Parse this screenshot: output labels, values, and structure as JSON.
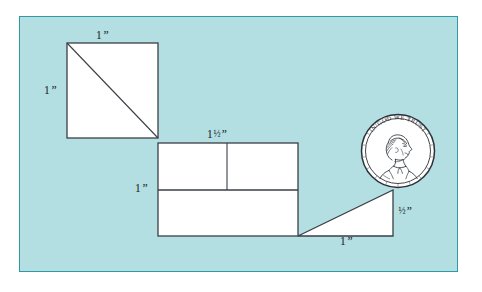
{
  "figure": {
    "panel": {
      "background_color": "#b3dee2",
      "border_color": "#2e9aa6",
      "page_background_color": "#ffffff"
    },
    "line_color": "#3a3f46",
    "shape_fill_color": "#ffffff"
  },
  "labels": {
    "square_top": {
      "value": "1",
      "fraction": "",
      "unit": "”"
    },
    "square_left": {
      "value": "1",
      "fraction": "",
      "unit": "”"
    },
    "middle_top": {
      "value": "1",
      "fraction": "½",
      "unit": "”"
    },
    "middle_left": {
      "value": "1",
      "fraction": "",
      "unit": "”"
    },
    "triangle_right": {
      "value": "",
      "fraction": "½",
      "unit": "”"
    },
    "triangle_bottom": {
      "value": "1",
      "fraction": "",
      "unit": "”"
    }
  },
  "coin": {
    "name": "penny",
    "motto": "IN GOD WE TRUST",
    "portrait": "lincoln-profile-right",
    "center_x": 398,
    "center_y": 151,
    "radius": 37
  },
  "shapes": {
    "square": {
      "x": 67,
      "y": 43,
      "width": 91,
      "height": 95,
      "has_diagonal": true
    },
    "middle_rectangle": {
      "x": 158,
      "y": 143,
      "width": 140,
      "height": 93,
      "horizontal_divider_y": 190,
      "vertical_divider_x": 227
    },
    "triangle": {
      "points": "298,236 393,236 393,190",
      "right_angle_corner": "bottom-right"
    }
  }
}
